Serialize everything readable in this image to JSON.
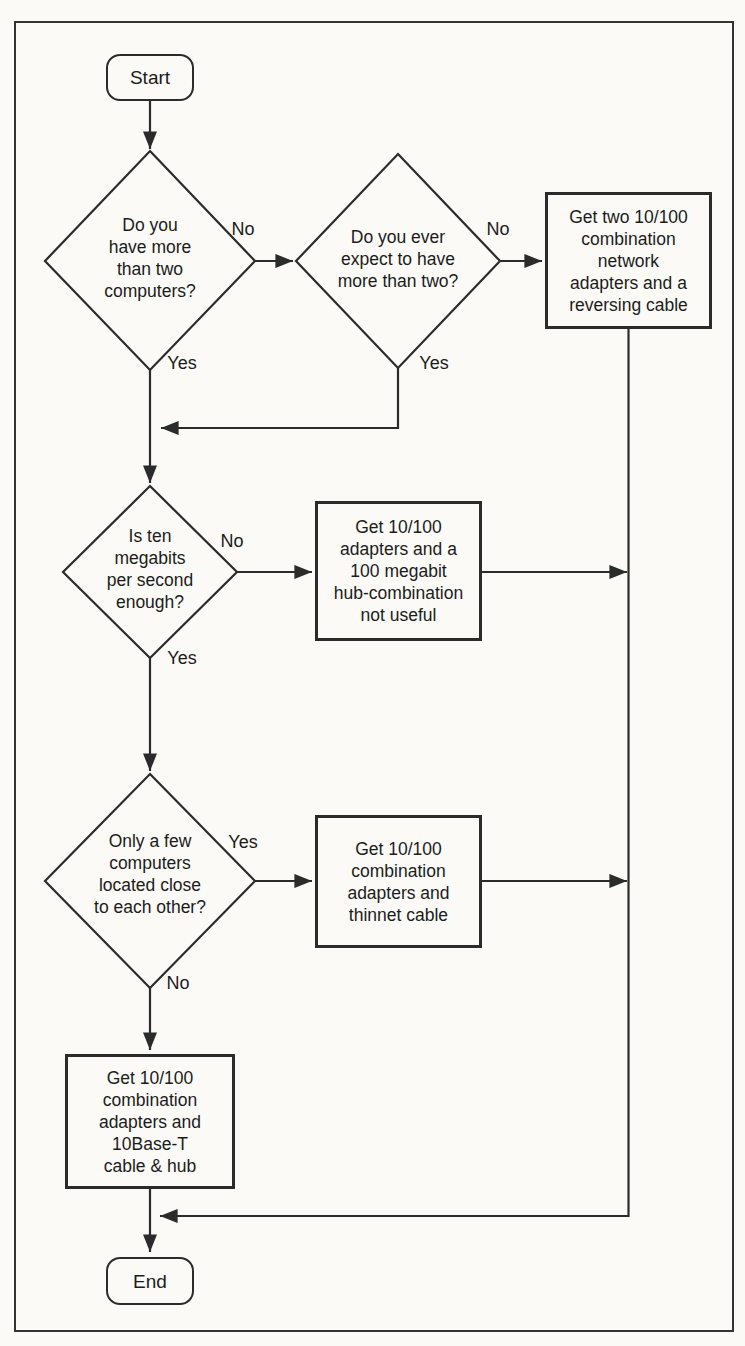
{
  "figure": {
    "colors": {
      "paper": "#fbfaf7",
      "line": "#2b2b2b",
      "text": "#1c1c1c"
    }
  },
  "nodes": {
    "start": {
      "label": "Start"
    },
    "end": {
      "label": "End"
    },
    "d1": {
      "label": "Do you\nhave more\nthan two\ncomputers?"
    },
    "d2": {
      "label": "Do you ever\nexpect to have\nmore than two?"
    },
    "d3": {
      "label": "Is ten\nmegabits\nper second\nenough?"
    },
    "d4": {
      "label": "Only a few\ncomputers\nlocated close\nto each other?"
    },
    "box_reversing": {
      "label": "Get two 10/100\ncombination\nnetwork\nadapters and a\nreversing cable"
    },
    "box_megabit_hub": {
      "label": "Get 10/100\nadapters and a\n100 megabit\nhub-combination\nnot useful"
    },
    "box_thinnet": {
      "label": "Get 10/100\ncombination\nadapters and\nthinnet cable"
    },
    "box_10baset": {
      "label": "Get 10/100\ncombination\nadapters and\n10Base-T\ncable & hub"
    }
  },
  "edge_labels": {
    "d1_no": "No",
    "d1_yes": "Yes",
    "d2_no": "No",
    "d2_yes": "Yes",
    "d3_no": "No",
    "d3_yes": "Yes",
    "d4_yes": "Yes",
    "d4_no": "No"
  }
}
